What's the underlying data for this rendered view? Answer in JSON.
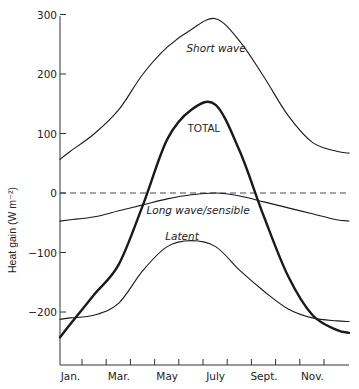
{
  "chart_data": {
    "type": "line",
    "title": "",
    "xlabel": "",
    "ylabel": "Heat gain (W m⁻²)",
    "ylim": [
      -270,
      300
    ],
    "yticks": [
      300,
      200,
      100,
      0,
      -100,
      -200
    ],
    "ytick_labels": [
      "300",
      "200",
      "100",
      "0",
      "−100",
      "−200"
    ],
    "categories": [
      "Jan.",
      "Feb.",
      "Mar.",
      "Apr.",
      "May",
      "June",
      "July",
      "Aug.",
      "Sept.",
      "Oct.",
      "Nov.",
      "Dec."
    ],
    "xtick_labels": [
      "Jan.",
      "Mar.",
      "May",
      "July",
      "Sept.",
      "Nov."
    ],
    "grid": false,
    "legend": "inline labels",
    "reference_line": {
      "y": 0,
      "style": "dashed"
    },
    "series": [
      {
        "name": "Short wave",
        "style": "thin",
        "values": [
          70,
          100,
          140,
          200,
          245,
          275,
          293,
          255,
          195,
          130,
          85,
          70
        ]
      },
      {
        "name": "TOTAL",
        "style": "thick",
        "values": [
          -220,
          -170,
          -120,
          -20,
          90,
          140,
          148,
          70,
          -40,
          -140,
          -205,
          -230
        ]
      },
      {
        "name": "Long wave/sensible",
        "style": "thin",
        "values": [
          -45,
          -40,
          -30,
          -20,
          -10,
          -3,
          0,
          -5,
          -15,
          -25,
          -35,
          -45
        ]
      },
      {
        "name": "Latent",
        "style": "thin",
        "values": [
          -210,
          -205,
          -185,
          -130,
          -90,
          -80,
          -90,
          -130,
          -165,
          -195,
          -210,
          -215
        ]
      }
    ],
    "annotations": [
      "Short wave",
      "TOTAL",
      "Long wave/sensible",
      "Latent"
    ]
  }
}
